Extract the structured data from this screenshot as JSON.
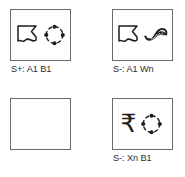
{
  "figure": {
    "layout": "2x2 stimulus grid",
    "columns": 2,
    "rows": 2
  },
  "colors": {
    "panel_border": "#6b6b6b",
    "icon_stroke": "#1d1d1d",
    "caption_text": "#2b2b2b",
    "background": "#ffffff"
  },
  "panels": [
    {
      "id": "panel-top-left",
      "position": "top-left",
      "caption": "S+: A1 B1",
      "has_caption": true,
      "icons": [
        {
          "name": "wavy-banner-icon",
          "label": "A1"
        },
        {
          "name": "dashed-circle-four-dots-icon",
          "label": "B1"
        }
      ]
    },
    {
      "id": "panel-top-right",
      "position": "top-right",
      "caption": "S-: A1 Wn",
      "has_caption": true,
      "icons": [
        {
          "name": "wavy-banner-icon",
          "label": "A1"
        },
        {
          "name": "swoosh-ribbon-icon",
          "label": "Wn"
        }
      ]
    },
    {
      "id": "panel-bottom-left",
      "position": "bottom-left",
      "caption": "",
      "has_caption": false,
      "icons": []
    },
    {
      "id": "panel-bottom-right",
      "position": "bottom-right",
      "caption": "S-: Xn B1",
      "has_caption": true,
      "icons": [
        {
          "name": "rupee-sign-icon",
          "label": "Xn",
          "glyph": "₹"
        },
        {
          "name": "dashed-circle-four-dots-icon",
          "label": "B1"
        }
      ]
    }
  ]
}
